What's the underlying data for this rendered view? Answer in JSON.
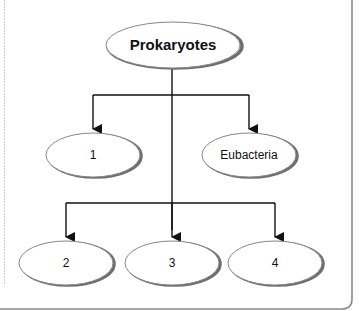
{
  "diagram": {
    "type": "tree",
    "root": {
      "id": "root",
      "label": "Prokaryotes"
    },
    "level1": [
      {
        "id": "n1",
        "label": "1"
      },
      {
        "id": "n_eubacteria",
        "label": "Eubacteria"
      }
    ],
    "level2": [
      {
        "id": "n2",
        "label": "2"
      },
      {
        "id": "n3",
        "label": "3"
      },
      {
        "id": "n4",
        "label": "4"
      }
    ],
    "edges": [
      {
        "from": "Prokaryotes",
        "to": "1"
      },
      {
        "from": "Prokaryotes",
        "to": "Eubacteria"
      },
      {
        "from": "Prokaryotes",
        "to": "2"
      },
      {
        "from": "Prokaryotes",
        "to": "3"
      },
      {
        "from": "Prokaryotes",
        "to": "4"
      }
    ],
    "colors": {
      "ellipse_stroke": "#888888",
      "ellipse_shadow": "#6e6e6e",
      "line": "#111111",
      "frame": "#8a8a8a"
    }
  }
}
